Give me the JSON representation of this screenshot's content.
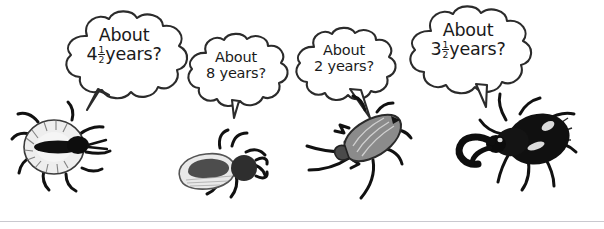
{
  "scene": {
    "width": 604,
    "height": 229,
    "background": "#ffffff",
    "ink_color": "#1a1a1a",
    "rule_color": "#c9c9cf",
    "description": "Four cartoon beetles each with a thought/speech bubble guessing a lifespan in years"
  },
  "bubbles": [
    {
      "id": "bubble-1",
      "line1": "About",
      "number": "4",
      "fraction_numerator": "1",
      "fraction_denominator": "2",
      "unit": "years?",
      "full_text": "About 4 1/2 years?",
      "tail_direction": "down-left"
    },
    {
      "id": "bubble-2",
      "line1": "About",
      "number": "8",
      "fraction_numerator": "",
      "fraction_denominator": "",
      "unit": "years?",
      "full_text": "About 8 years?",
      "tail_direction": "down"
    },
    {
      "id": "bubble-3",
      "line1": "About",
      "number": "2",
      "fraction_numerator": "",
      "fraction_denominator": "",
      "unit": "years?",
      "full_text": "About 2 years?",
      "tail_direction": "down-right"
    },
    {
      "id": "bubble-4",
      "line1": "About",
      "number": "3",
      "fraction_numerator": "1",
      "fraction_denominator": "2",
      "unit": "years?",
      "full_text": "About 3 1/2 years?",
      "tail_direction": "down-right"
    }
  ],
  "bugs": [
    {
      "id": "bug-1",
      "name": "round-pale-tick-illustration",
      "body_fill": "#efefef",
      "dark_fill": "#161616"
    },
    {
      "id": "bug-2",
      "name": "grey-elytra-beetle-illustration",
      "body_fill": "#e6e6e6",
      "dark_fill": "#3a3a3a"
    },
    {
      "id": "bug-3",
      "name": "long-striped-beetle-illustration",
      "body_fill": "#8a8a8a",
      "dark_fill": "#141414"
    },
    {
      "id": "bug-4",
      "name": "black-pincer-beetle-illustration",
      "body_fill": "#121212",
      "dark_fill": "#000000"
    }
  ]
}
